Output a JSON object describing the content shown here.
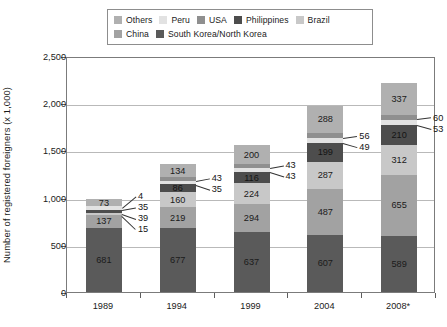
{
  "legend": {
    "rows": [
      [
        {
          "label": "Others",
          "color": "#b0b0b0"
        },
        {
          "label": "Peru",
          "color": "#e2e2e2"
        },
        {
          "label": "USA",
          "color": "#8f8f8f"
        },
        {
          "label": "Philippines",
          "color": "#4d4d4d"
        },
        {
          "label": "Brazil",
          "color": "#c8c8c8"
        }
      ],
      [
        {
          "label": "China",
          "color": "#a2a2a2"
        },
        {
          "label": "South Korea/North Korea",
          "color": "#5a5a5a"
        }
      ]
    ]
  },
  "axes": {
    "y_title": "Number of registered foreigners (x 1,000)",
    "y_ticks": [
      "0",
      "500",
      "1,000",
      "1,500",
      "2,000",
      "2,500"
    ],
    "x_ticks": [
      "1989",
      "1994",
      "1999",
      "2004",
      "2008*"
    ]
  },
  "chart_data": {
    "type": "bar",
    "subtype": "stacked",
    "title": "",
    "xlabel": "",
    "ylabel": "Number of registered foreigners (x 1,000)",
    "ylim": [
      0,
      2500
    ],
    "ytick_values": [
      0,
      500,
      1000,
      1500,
      2000,
      2500
    ],
    "grid": true,
    "legend_position": "top",
    "categories": [
      "1989",
      "1994",
      "1999",
      "2004",
      "2008*"
    ],
    "series": [
      {
        "name": "South Korea/North Korea",
        "color": "#5a5a5a",
        "values": [
          681,
          677,
          637,
          607,
          589
        ]
      },
      {
        "name": "China",
        "color": "#a2a2a2",
        "values": [
          137,
          219,
          294,
          487,
          655
        ]
      },
      {
        "name": "Brazil",
        "color": "#c8c8c8",
        "values": [
          15,
          160,
          224,
          287,
          312
        ]
      },
      {
        "name": "Philippines",
        "color": "#4d4d4d",
        "values": [
          39,
          86,
          116,
          199,
          210
        ]
      },
      {
        "name": "Peru",
        "color": "#e2e2e2",
        "values": [
          35,
          35,
          43,
          49,
          53
        ]
      },
      {
        "name": "USA",
        "color": "#8f8f8f",
        "values": [
          4,
          43,
          43,
          56,
          60
        ]
      },
      {
        "name": "Others",
        "color": "#b0b0b0",
        "values": [
          73,
          134,
          200,
          288,
          337
        ]
      }
    ],
    "bars": [
      {
        "category": "1989",
        "total": 984,
        "segments": [
          {
            "name": "South Korea/North Korea",
            "value": 681,
            "label": "681",
            "color": "#5a5a5a",
            "label_mode": "inside"
          },
          {
            "name": "China",
            "value": 137,
            "label": "137",
            "color": "#a2a2a2",
            "label_mode": "inside"
          },
          {
            "name": "Brazil",
            "value": 15,
            "label": "15",
            "color": "#c8c8c8",
            "label_mode": "callout"
          },
          {
            "name": "Philippines",
            "value": 39,
            "label": "39",
            "color": "#4d4d4d",
            "label_mode": "callout"
          },
          {
            "name": "Peru",
            "value": 35,
            "label": "35",
            "color": "#e2e2e2",
            "label_mode": "callout"
          },
          {
            "name": "USA",
            "value": 4,
            "label": "4",
            "color": "#8f8f8f",
            "label_mode": "callout"
          },
          {
            "name": "Others",
            "value": 73,
            "label": "73",
            "color": "#b0b0b0",
            "label_mode": "inside"
          }
        ]
      },
      {
        "category": "1994",
        "total": 1354,
        "segments": [
          {
            "name": "South Korea/North Korea",
            "value": 677,
            "label": "677",
            "color": "#5a5a5a",
            "label_mode": "inside"
          },
          {
            "name": "China",
            "value": 219,
            "label": "219",
            "color": "#a2a2a2",
            "label_mode": "inside"
          },
          {
            "name": "Brazil",
            "value": 160,
            "label": "160",
            "color": "#c8c8c8",
            "label_mode": "inside"
          },
          {
            "name": "Philippines",
            "value": 86,
            "label": "86",
            "color": "#4d4d4d",
            "label_mode": "inside"
          },
          {
            "name": "Peru",
            "value": 35,
            "label": "35",
            "color": "#e2e2e2",
            "label_mode": "callout"
          },
          {
            "name": "USA",
            "value": 43,
            "label": "43",
            "color": "#8f8f8f",
            "label_mode": "callout"
          },
          {
            "name": "Others",
            "value": 134,
            "label": "134",
            "color": "#b0b0b0",
            "label_mode": "inside"
          }
        ]
      },
      {
        "category": "1999",
        "total": 1557,
        "segments": [
          {
            "name": "South Korea/North Korea",
            "value": 637,
            "label": "637",
            "color": "#5a5a5a",
            "label_mode": "inside"
          },
          {
            "name": "China",
            "value": 294,
            "label": "294",
            "color": "#a2a2a2",
            "label_mode": "inside"
          },
          {
            "name": "Brazil",
            "value": 224,
            "label": "224",
            "color": "#c8c8c8",
            "label_mode": "inside"
          },
          {
            "name": "Philippines",
            "value": 116,
            "label": "116",
            "color": "#4d4d4d",
            "label_mode": "inside"
          },
          {
            "name": "Peru",
            "value": 43,
            "label": "43",
            "color": "#e2e2e2",
            "label_mode": "callout"
          },
          {
            "name": "USA",
            "value": 43,
            "label": "43",
            "color": "#8f8f8f",
            "label_mode": "callout"
          },
          {
            "name": "Others",
            "value": 200,
            "label": "200",
            "color": "#b0b0b0",
            "label_mode": "inside"
          }
        ]
      },
      {
        "category": "2004",
        "total": 1973,
        "segments": [
          {
            "name": "South Korea/North Korea",
            "value": 607,
            "label": "607",
            "color": "#5a5a5a",
            "label_mode": "inside"
          },
          {
            "name": "China",
            "value": 487,
            "label": "487",
            "color": "#a2a2a2",
            "label_mode": "inside"
          },
          {
            "name": "Brazil",
            "value": 287,
            "label": "287",
            "color": "#c8c8c8",
            "label_mode": "inside"
          },
          {
            "name": "Philippines",
            "value": 199,
            "label": "199",
            "color": "#4d4d4d",
            "label_mode": "inside"
          },
          {
            "name": "Peru",
            "value": 49,
            "label": "49",
            "color": "#e2e2e2",
            "label_mode": "callout"
          },
          {
            "name": "USA",
            "value": 56,
            "label": "56",
            "color": "#8f8f8f",
            "label_mode": "callout"
          },
          {
            "name": "Others",
            "value": 288,
            "label": "288",
            "color": "#b0b0b0",
            "label_mode": "inside"
          }
        ]
      },
      {
        "category": "2008*",
        "total": 2216,
        "segments": [
          {
            "name": "South Korea/North Korea",
            "value": 589,
            "label": "589",
            "color": "#5a5a5a",
            "label_mode": "inside"
          },
          {
            "name": "China",
            "value": 655,
            "label": "655",
            "color": "#a2a2a2",
            "label_mode": "inside"
          },
          {
            "name": "Brazil",
            "value": 312,
            "label": "312",
            "color": "#c8c8c8",
            "label_mode": "inside"
          },
          {
            "name": "Philippines",
            "value": 210,
            "label": "210",
            "color": "#4d4d4d",
            "label_mode": "inside"
          },
          {
            "name": "Peru",
            "value": 53,
            "label": "53",
            "color": "#e2e2e2",
            "label_mode": "callout"
          },
          {
            "name": "USA",
            "value": 60,
            "label": "60",
            "color": "#8f8f8f",
            "label_mode": "callout"
          },
          {
            "name": "Others",
            "value": 337,
            "label": "337",
            "color": "#b0b0b0",
            "label_mode": "inside"
          }
        ]
      }
    ]
  }
}
